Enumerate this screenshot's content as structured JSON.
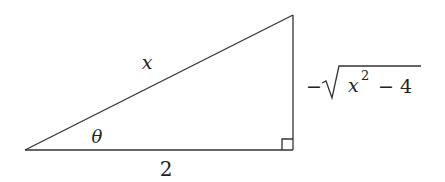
{
  "diagram": {
    "type": "right-triangle",
    "stroke_color": "#333333",
    "background": "#ffffff",
    "vertices": {
      "left": [
        25,
        150
      ],
      "right_angle": [
        293,
        150
      ],
      "top": [
        293,
        15
      ]
    },
    "labels": {
      "hypotenuse": "x",
      "adjacent": "2",
      "opposite_minus": "−",
      "opposite_var": "x",
      "opposite_exp": "2",
      "opposite_rest": " − 4",
      "angle": "θ"
    },
    "right_angle_marker": true
  }
}
